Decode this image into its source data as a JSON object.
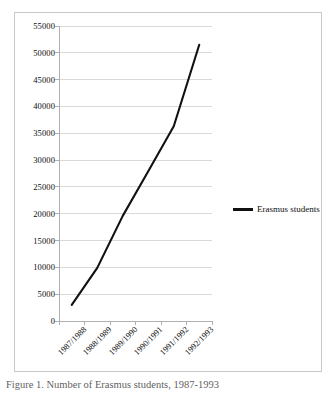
{
  "figure": {
    "caption": "Figure 1. Number of Erasmus students, 1987-1993",
    "legend_label": "Erasmus students",
    "legend_swatch_name": "legend-line-swatch",
    "series_color": "#111111",
    "gridline_color": "#d9d9d9",
    "axis_color": "#b0b0b0",
    "border_color": "#c8c8c8"
  },
  "chart_data": {
    "type": "line",
    "title": "",
    "xlabel": "",
    "ylabel": "",
    "categories": [
      "1987/1988",
      "1988/1989",
      "1989/1990",
      "1990/1991",
      "1991/1992",
      "1992/1993"
    ],
    "series": [
      {
        "name": "Erasmus students",
        "values": [
          3000,
          9900,
          19600,
          27900,
          36300,
          51500
        ]
      }
    ],
    "ylim": [
      0,
      55000
    ],
    "ytick_step": 5000,
    "ytick_labels": [
      "0",
      "5000",
      "10000",
      "15000",
      "20000",
      "25000",
      "30000",
      "35000",
      "40000",
      "45000",
      "50000",
      "55000"
    ],
    "ytick_values": [
      0,
      5000,
      10000,
      15000,
      20000,
      25000,
      30000,
      35000,
      40000,
      45000,
      50000,
      55000
    ],
    "grid": true,
    "grid_axis": "y",
    "legend": true,
    "legend_position": "right",
    "markers": false
  }
}
